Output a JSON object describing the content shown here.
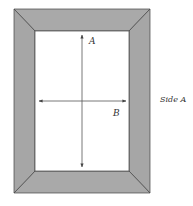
{
  "diagram": {
    "frame": {
      "outer": {
        "x1": 14,
        "y1": 9,
        "x2": 150,
        "y2": 193
      },
      "inner": {
        "x1": 35,
        "y1": 31,
        "x2": 129,
        "y2": 171
      },
      "fill_color": "#a9a9a9",
      "edge_color": "#444444"
    },
    "arrows": [
      {
        "id": "A",
        "orientation": "vertical",
        "x": 82,
        "y1": 35,
        "y2": 167,
        "label": "A"
      },
      {
        "id": "B",
        "orientation": "horizontal",
        "y": 101,
        "x1": 39,
        "x2": 126,
        "label": "B"
      }
    ],
    "side_label": "Side A"
  }
}
